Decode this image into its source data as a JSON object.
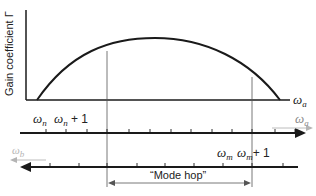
{
  "diagram": {
    "y_axis_label": "Gain coefficient Γ",
    "x_axis_symbol": "ω",
    "x_axis_subscript": "a",
    "gain_curve": {
      "description": "Parabolic gain profile of the amplifier medium",
      "start_x": 37,
      "peak_x": 155,
      "peak_y": 38,
      "end_x": 280,
      "baseline_y": 100
    },
    "mode_axis_a": {
      "label_symbol": "ω",
      "label_subscript": "a",
      "direction": "right",
      "tick_labels": [
        {
          "symbol": "ω",
          "subscript": "n",
          "suffix": ""
        },
        {
          "symbol": "ω",
          "subscript": "n",
          "suffix": " + 1"
        }
      ],
      "ticks_x": [
        46,
        66,
        87,
        107,
        129,
        150,
        171,
        191,
        212,
        232,
        252,
        275,
        295
      ]
    },
    "mode_axis_b": {
      "label_symbol": "ω",
      "label_subscript": "b",
      "direction": "left",
      "tick_labels": [
        {
          "symbol": "ω",
          "subscript": "m",
          "suffix": ""
        },
        {
          "symbol": "ω",
          "subscript": "m",
          "suffix": "+ 1"
        }
      ],
      "ticks_x": [
        50,
        79,
        107,
        137,
        165,
        194,
        223,
        252,
        283
      ]
    },
    "mode_hop_label": "“Mode hop”",
    "colors": {
      "line": "#1a1a1a",
      "guide": "#555555",
      "faded": "#b4b4b4"
    }
  }
}
